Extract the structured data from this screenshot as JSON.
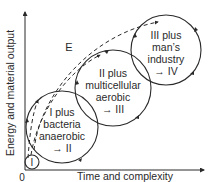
{
  "axes": {
    "y_label": "Energy and material output",
    "x_label": "Time and complexity",
    "origin_label": "0"
  },
  "curve_label": "E",
  "stages": [
    {
      "id": "I",
      "lines": [
        "I"
      ]
    },
    {
      "id": "II",
      "lines": [
        "I plus",
        "bacteria",
        "anaerobic",
        "→ II"
      ]
    },
    {
      "id": "III",
      "lines": [
        "II plus",
        "multicellular",
        "aerobic",
        "→ III"
      ]
    },
    {
      "id": "IV",
      "lines": [
        "III plus",
        "man’s",
        "industry",
        "→ IV"
      ]
    }
  ],
  "colors": {
    "line": "#2a2a2a",
    "background": "#ffffff"
  }
}
